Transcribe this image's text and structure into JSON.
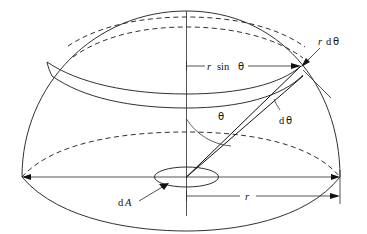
{
  "figure": {
    "name": "hemisphere-solid-angle-diagram",
    "type": "geometry-diagram",
    "colors": {
      "background": "#ffffff",
      "line": "#1a1a1a",
      "thin_line": "#2a2a2a",
      "label": "#111111"
    }
  },
  "labels": {
    "ring_radius": {
      "italic_part": "r",
      "roman_part": "sin",
      "greek_part": "θ",
      "full": "r sin θ",
      "x": 216,
      "y": 68
    },
    "arc_length": {
      "italic_part": "r",
      "roman_part": "d",
      "greek_part": "θ",
      "full": "r dθ",
      "x": 324,
      "y": 42
    },
    "angular_width": {
      "roman_part": "d",
      "greek_part": "θ",
      "full": "dθ",
      "x": 282,
      "y": 120
    },
    "polar_angle": {
      "greek_part": "θ",
      "full": "θ",
      "x": 221,
      "y": 116
    },
    "area_element": {
      "roman_part": "d",
      "italic_part": "A",
      "full": "dA",
      "x": 124,
      "y": 203
    },
    "radius": {
      "italic_part": "r",
      "full": "r",
      "x": 248,
      "y": 199
    }
  },
  "geometry": {
    "origin": {
      "x": 186.5,
      "y": 177
    },
    "apex": {
      "x": 186.5,
      "y": 11
    },
    "base_left": {
      "x": 22,
      "y": 177
    },
    "base_right": {
      "x": 340,
      "y": 177
    },
    "zone_point": {
      "x": 301,
      "y": 66
    },
    "hemisphere_radius_px": 166,
    "base_ellipse_ry": 26,
    "dA_ellipse": {
      "cx": 186.5,
      "cy": 177,
      "rx": 32,
      "ry": 10
    },
    "theta_arc_radius": 58,
    "dtheta_arc_radius": 46
  }
}
